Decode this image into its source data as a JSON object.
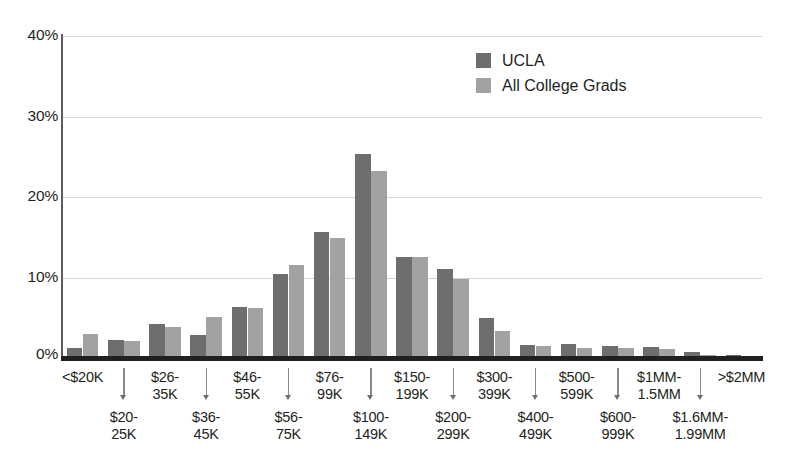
{
  "chart_data": {
    "type": "bar",
    "title": "",
    "subtitle": "",
    "xlabel": "",
    "ylabel": "",
    "ylim": [
      0,
      40
    ],
    "y_ticks": [
      "0%",
      "10%",
      "20%",
      "30%",
      "40%"
    ],
    "y_tick_values": [
      0,
      10,
      20,
      30,
      40
    ],
    "grid": "horizontal",
    "legend_position": "top-right",
    "categories": [
      "<$20K",
      "$20-\n25K",
      "$26-\n35K",
      "$36-\n45K",
      "$46-\n55K",
      "$56-\n75K",
      "$76-\n99K",
      "$100-\n149K",
      "$150-\n199K",
      "$200-\n299K",
      "$300-\n399K",
      "$400-\n499K",
      "$500-\n599K",
      "$600-\n999K",
      "$1MM-\n1.5MM",
      "$1.6MM-\n1.99MM",
      ">$2MM"
    ],
    "series": [
      {
        "name": "UCLA",
        "color": "#6e6e6e",
        "values": [
          1.2,
          2.3,
          4.2,
          2.9,
          6.3,
          10.4,
          15.6,
          25.4,
          12.6,
          11.0,
          5.0,
          1.6,
          1.8,
          1.5,
          1.4,
          0.8,
          0.4
        ]
      },
      {
        "name": "All College Grads",
        "color": "#a2a2a2",
        "values": [
          3.0,
          2.1,
          3.8,
          5.1,
          6.2,
          11.5,
          14.9,
          23.2,
          12.6,
          9.8,
          3.3,
          1.5,
          1.3,
          1.3,
          1.1,
          0.4,
          0.3
        ]
      }
    ]
  },
  "legend": {
    "items": [
      {
        "label": "UCLA",
        "color": "#6e6e6e"
      },
      {
        "label": "All College Grads",
        "color": "#a2a2a2"
      }
    ]
  },
  "axis": {
    "y_labels": [
      "40%",
      "30%",
      "20%",
      "10%",
      "0%"
    ]
  }
}
